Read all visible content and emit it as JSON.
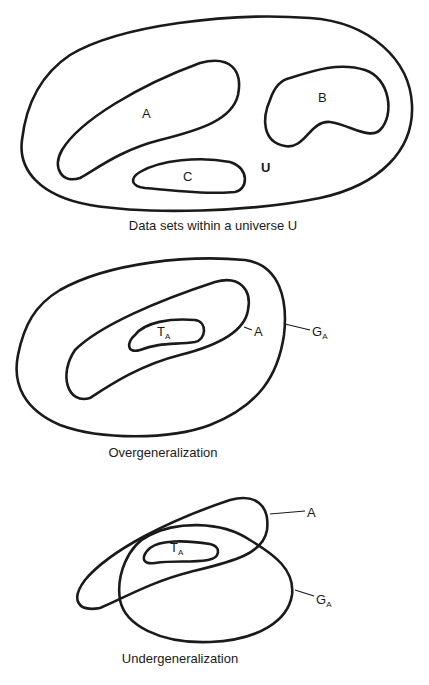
{
  "figure_1": {
    "caption": "Data sets within a universe U",
    "labels": {
      "a": "A",
      "b": "B",
      "c": "C",
      "u": "U"
    }
  },
  "figure_2": {
    "caption": "Overgeneralization",
    "labels": {
      "t": "T",
      "t_sub": "A",
      "a": "A",
      "g": "G",
      "g_sub": "A"
    }
  },
  "figure_3": {
    "caption": "Undergeneralization",
    "labels": {
      "t": "T",
      "t_sub": "A",
      "a": "A",
      "g": "G",
      "g_sub": "A"
    }
  },
  "colors": {
    "stroke": "#1a1a1a",
    "background": "#ffffff"
  }
}
